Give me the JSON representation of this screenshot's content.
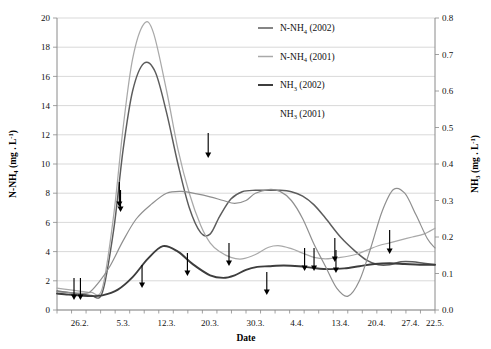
{
  "chart_data": {
    "type": "line",
    "title": "",
    "xlabel": "Date",
    "ylabel": "N-NH4 (mg . L-1)",
    "ylabel_right": "NH3 (mg . L-1)",
    "xlabel_text": "Date",
    "ylabel_main": "N-NH",
    "ylabel_main_sub": "4",
    "ylabel_main_unit": "(mg . L",
    "ylabel_main_sup": "-1",
    "ylabel_right_main": "NH",
    "ylabel_right_sub": "3",
    "ylabel_right_unit": "(mg . L",
    "ylabel_right_sup": "-1",
    "grid": true,
    "legend_position": "top-right",
    "categories": [
      "26.2.",
      "5.3.",
      "12.3.",
      "20.3.",
      "30.3.",
      "4.4.",
      "13.4.",
      "20.4.",
      "27.4.",
      "22.5."
    ],
    "xtick_labels": [
      "26.2.",
      "5.3.",
      "12.3.",
      "20.3.",
      "30.3.",
      "4.4.",
      "13.4.",
      "20.4.",
      "27.4.",
      "22.5."
    ],
    "xtick_positions": [
      0.06,
      0.175,
      0.29,
      0.405,
      0.525,
      0.635,
      0.75,
      0.845,
      0.935,
      1.0
    ],
    "ylim": [
      0,
      20
    ],
    "ytick_labels": [
      "0",
      "2",
      "4",
      "6",
      "8",
      "10",
      "12",
      "14",
      "16",
      "18",
      "20"
    ],
    "ytick_values": [
      0,
      2,
      4,
      6,
      8,
      10,
      12,
      14,
      16,
      18,
      20
    ],
    "ylim_right": [
      0.0,
      0.8
    ],
    "ytick_labels_right": [
      "0.0",
      "0.1",
      "0.2",
      "0.3",
      "0.4",
      "0.5",
      "0.6",
      "0.7",
      "0.8"
    ],
    "ytick_values_right": [
      0.0,
      0.1,
      0.2,
      0.3,
      0.4,
      0.5,
      0.6,
      0.7,
      0.8
    ],
    "series": [
      {
        "name": "N-NH4 (2002)",
        "name_main": "N-NH",
        "name_sub": "4",
        "name_year": "(2002)",
        "axis": "left",
        "color": "#5c5c5c",
        "has_marker": true,
        "x": [
          0.0,
          0.03,
          0.06,
          0.09,
          0.12,
          0.15,
          0.175,
          0.2,
          0.23,
          0.26,
          0.29,
          0.32,
          0.35,
          0.38,
          0.405,
          0.43,
          0.46,
          0.49,
          0.525,
          0.56,
          0.59,
          0.62,
          0.65,
          0.68,
          0.71,
          0.75,
          0.79,
          0.82,
          0.85,
          0.88,
          0.91,
          0.94,
          0.97,
          1.0
        ],
        "y": [
          1.3,
          1.2,
          1.1,
          1.0,
          1.2,
          5.5,
          11.0,
          15.0,
          16.9,
          16.3,
          13.5,
          10.0,
          7.0,
          5.3,
          5.2,
          6.4,
          7.6,
          8.1,
          8.2,
          8.2,
          8.2,
          8.1,
          7.8,
          7.2,
          6.3,
          5.0,
          4.0,
          3.4,
          3.1,
          3.1,
          3.3,
          3.3,
          3.2,
          3.1
        ]
      },
      {
        "name": "N-NH4 (2001)",
        "name_main": "N-NH",
        "name_sub": "4",
        "name_year": "(2001)",
        "axis": "left",
        "color": "#a9a9a9",
        "has_marker": true,
        "x": [
          0.0,
          0.03,
          0.06,
          0.09,
          0.12,
          0.15,
          0.175,
          0.2,
          0.23,
          0.255,
          0.29,
          0.32,
          0.35,
          0.38,
          0.405,
          0.43,
          0.46,
          0.49,
          0.525,
          0.56,
          0.59,
          0.62,
          0.65,
          0.68,
          0.71,
          0.75,
          0.79,
          0.82,
          0.85,
          0.88,
          0.91,
          0.94,
          0.97,
          1.0
        ],
        "y": [
          1.5,
          1.4,
          1.3,
          1.2,
          1.5,
          6.5,
          12.5,
          17.2,
          19.6,
          19.0,
          15.0,
          11.0,
          8.0,
          5.8,
          4.6,
          4.0,
          3.6,
          3.5,
          3.8,
          4.3,
          4.4,
          4.2,
          3.9,
          3.6,
          3.5,
          3.6,
          3.8,
          4.1,
          4.4,
          4.6,
          4.8,
          5.0,
          5.2,
          5.6
        ]
      },
      {
        "name": "NH3 (2002)",
        "name_main": "NH",
        "name_sub": "3",
        "name_year": "(2002)",
        "axis": "right",
        "color": "#3d3d3d",
        "has_marker": true,
        "x": [
          0.0,
          0.03,
          0.06,
          0.09,
          0.12,
          0.16,
          0.2,
          0.24,
          0.28,
          0.32,
          0.36,
          0.405,
          0.44,
          0.47,
          0.5,
          0.53,
          0.56,
          0.6,
          0.64,
          0.68,
          0.72,
          0.76,
          0.8,
          0.84,
          0.88,
          0.92,
          0.96,
          1.0
        ],
        "y": [
          0.045,
          0.042,
          0.04,
          0.038,
          0.04,
          0.055,
          0.09,
          0.14,
          0.175,
          0.16,
          0.125,
          0.095,
          0.088,
          0.095,
          0.11,
          0.118,
          0.12,
          0.122,
          0.12,
          0.115,
          0.112,
          0.114,
          0.12,
          0.126,
          0.128,
          0.126,
          0.124,
          0.124
        ]
      },
      {
        "name": "NH3 (2001)",
        "name_main": "NH",
        "name_sub": "3",
        "name_year": "(2001)",
        "axis": "right",
        "color": "#8f8f8f",
        "has_marker": false,
        "x": [
          0.0,
          0.03,
          0.06,
          0.085,
          0.11,
          0.14,
          0.175,
          0.21,
          0.25,
          0.29,
          0.33,
          0.37,
          0.405,
          0.44,
          0.47,
          0.5,
          0.525,
          0.56,
          0.59,
          0.62,
          0.65,
          0.68,
          0.71,
          0.74,
          0.77,
          0.8,
          0.83,
          0.86,
          0.89,
          0.92,
          0.95,
          0.98,
          1.0
        ],
        "y": [
          0.05,
          0.048,
          0.046,
          0.048,
          0.075,
          0.12,
          0.19,
          0.25,
          0.29,
          0.32,
          0.325,
          0.318,
          0.31,
          0.3,
          0.292,
          0.3,
          0.32,
          0.33,
          0.325,
          0.3,
          0.25,
          0.18,
          0.12,
          0.06,
          0.038,
          0.08,
          0.17,
          0.27,
          0.33,
          0.32,
          0.26,
          0.195,
          0.17
        ]
      }
    ],
    "annotations": {
      "label": "sampling-arrows",
      "description": "Downward arrows marking sampling events",
      "arrows": [
        {
          "x": 0.045,
          "y_top": 278,
          "y_bottom": 300
        },
        {
          "x": 0.062,
          "y_top": 278,
          "y_bottom": 300
        },
        {
          "x": 0.165,
          "y_top": 182,
          "y_bottom": 207
        },
        {
          "x": 0.168,
          "y_top": 190,
          "y_bottom": 212
        },
        {
          "x": 0.225,
          "y_top": 265,
          "y_bottom": 288
        },
        {
          "x": 0.4,
          "y_top": 133,
          "y_bottom": 158
        },
        {
          "x": 0.345,
          "y_top": 253,
          "y_bottom": 276
        },
        {
          "x": 0.455,
          "y_top": 243,
          "y_bottom": 266
        },
        {
          "x": 0.555,
          "y_top": 272,
          "y_bottom": 295
        },
        {
          "x": 0.655,
          "y_top": 248,
          "y_bottom": 271
        },
        {
          "x": 0.68,
          "y_top": 248,
          "y_bottom": 271
        },
        {
          "x": 0.735,
          "y_top": 238,
          "y_bottom": 262
        },
        {
          "x": 0.738,
          "y_top": 250,
          "y_bottom": 273
        },
        {
          "x": 0.88,
          "y_top": 230,
          "y_bottom": 254
        }
      ]
    }
  },
  "legend": {
    "entries": [
      {
        "label_main": "N-NH",
        "label_sub": "4",
        "label_year": "(2002)",
        "color": "#5c5c5c",
        "has_line": true
      },
      {
        "label_main": "N-NH",
        "label_sub": "4",
        "label_year": "(2001)",
        "color": "#a9a9a9",
        "has_line": true
      },
      {
        "label_main": "NH",
        "label_sub": "3",
        "label_year": "(2002)",
        "color": "#3d3d3d",
        "has_line": true
      },
      {
        "label_main": "NH",
        "label_sub": "3",
        "label_year": "(2001)",
        "color": "#8f8f8f",
        "has_line": false
      }
    ]
  }
}
